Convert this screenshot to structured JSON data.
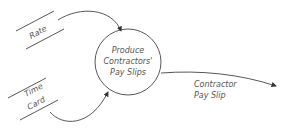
{
  "diagram": {
    "type": "data-flow-diagram",
    "process": {
      "label_lines": [
        "Produce",
        "Contractors'",
        "Pay Slips"
      ]
    },
    "data_stores": [
      {
        "name": "rate",
        "label_lines": [
          "Rate"
        ]
      },
      {
        "name": "time-card",
        "label_lines": [
          "Time",
          "Card"
        ]
      }
    ],
    "flows": [
      {
        "from": "Rate",
        "to": "Produce Contractors' Pay Slips",
        "label": ""
      },
      {
        "from": "Time Card",
        "to": "Produce Contractors' Pay Slips",
        "label": ""
      },
      {
        "from": "Produce Contractors' Pay Slips",
        "to": "external",
        "label_lines": [
          "Contractor",
          "Pay Slip"
        ]
      }
    ],
    "colors": {
      "stroke": "#444444",
      "text": "#555555",
      "background": "#ffffff"
    }
  }
}
